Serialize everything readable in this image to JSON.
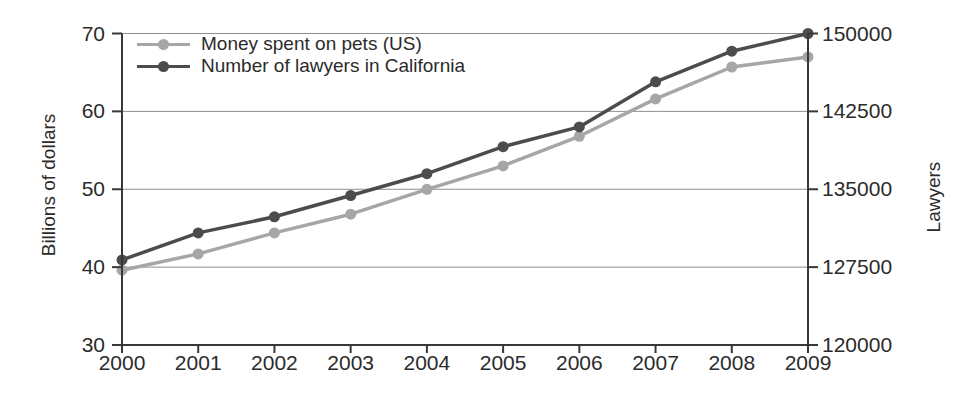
{
  "chart_data": {
    "type": "line",
    "title": "",
    "x": [
      2000,
      2001,
      2002,
      2003,
      2004,
      2005,
      2006,
      2007,
      2008,
      2009
    ],
    "series": [
      {
        "name": "Money spent on pets (US)",
        "axis": "left",
        "color": "#a6a6a6",
        "marker": "circle",
        "values": [
          39.6,
          41.7,
          44.4,
          46.8,
          50.0,
          53.0,
          56.8,
          61.6,
          65.7,
          67.0
        ]
      },
      {
        "name": "Number of lawyers in California",
        "axis": "right",
        "color": "#4c4c4c",
        "marker": "circle",
        "values": [
          128200,
          130800,
          132350,
          134400,
          136500,
          139100,
          141000,
          145350,
          148300,
          150000
        ]
      }
    ],
    "left_axis": {
      "label": "Billions of dollars",
      "ticks": [
        30,
        40,
        50,
        60,
        70
      ],
      "range": [
        30,
        70
      ]
    },
    "right_axis": {
      "label": "Lawyers",
      "ticks": [
        120000,
        127500,
        135000,
        142500,
        150000
      ],
      "range": [
        120000,
        150000
      ]
    },
    "x_axis": {
      "label": "",
      "ticks": [
        2000,
        2001,
        2002,
        2003,
        2004,
        2005,
        2006,
        2007,
        2008,
        2009
      ],
      "range": [
        2000,
        2009
      ]
    },
    "grid": "horizontal",
    "legend_position": "top-left-inside",
    "colors": {
      "axis": "#383838",
      "grid": "#8f8f8f",
      "text": "#2b2b2b",
      "background": "#ffffff"
    }
  }
}
